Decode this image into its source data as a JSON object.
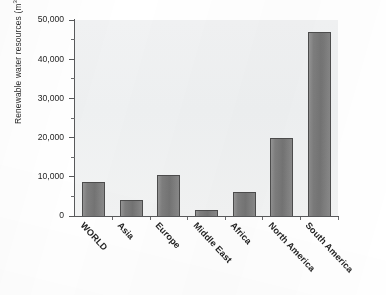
{
  "chart_data": {
    "type": "bar",
    "title": "",
    "subtitle": "",
    "xlabel": "",
    "ylabel": "Renewable water resources (m3) per capita",
    "ylabel_parts": {
      "before": "Renewable water resources (m",
      "superscript": "3",
      "after": ") per capita"
    },
    "categories": [
      "WORLD",
      "Asia",
      "Europe",
      "Middle East",
      "Africa",
      "North America",
      "South America"
    ],
    "values": [
      8700,
      4100,
      10500,
      1600,
      6200,
      20000,
      47000
    ],
    "ylim": [
      0,
      50000
    ],
    "y_major_ticks": [
      0,
      10000,
      20000,
      30000,
      40000,
      50000
    ],
    "y_major_tick_labels": [
      "0",
      "10,000",
      "20,000",
      "30,000",
      "40,000",
      "50,000"
    ],
    "y_minor_ticks": [
      5000,
      15000,
      25000,
      35000,
      45000
    ],
    "grid": false,
    "legend": false,
    "legend_position": "none",
    "bar_color": "#7e7e7e",
    "bar_edge_color": "#4c4c4c",
    "plot_background_color": "#eef0f1",
    "axis_color": "#58595b",
    "text_color": "#242424",
    "x_tick_label_rotation": 47
  }
}
